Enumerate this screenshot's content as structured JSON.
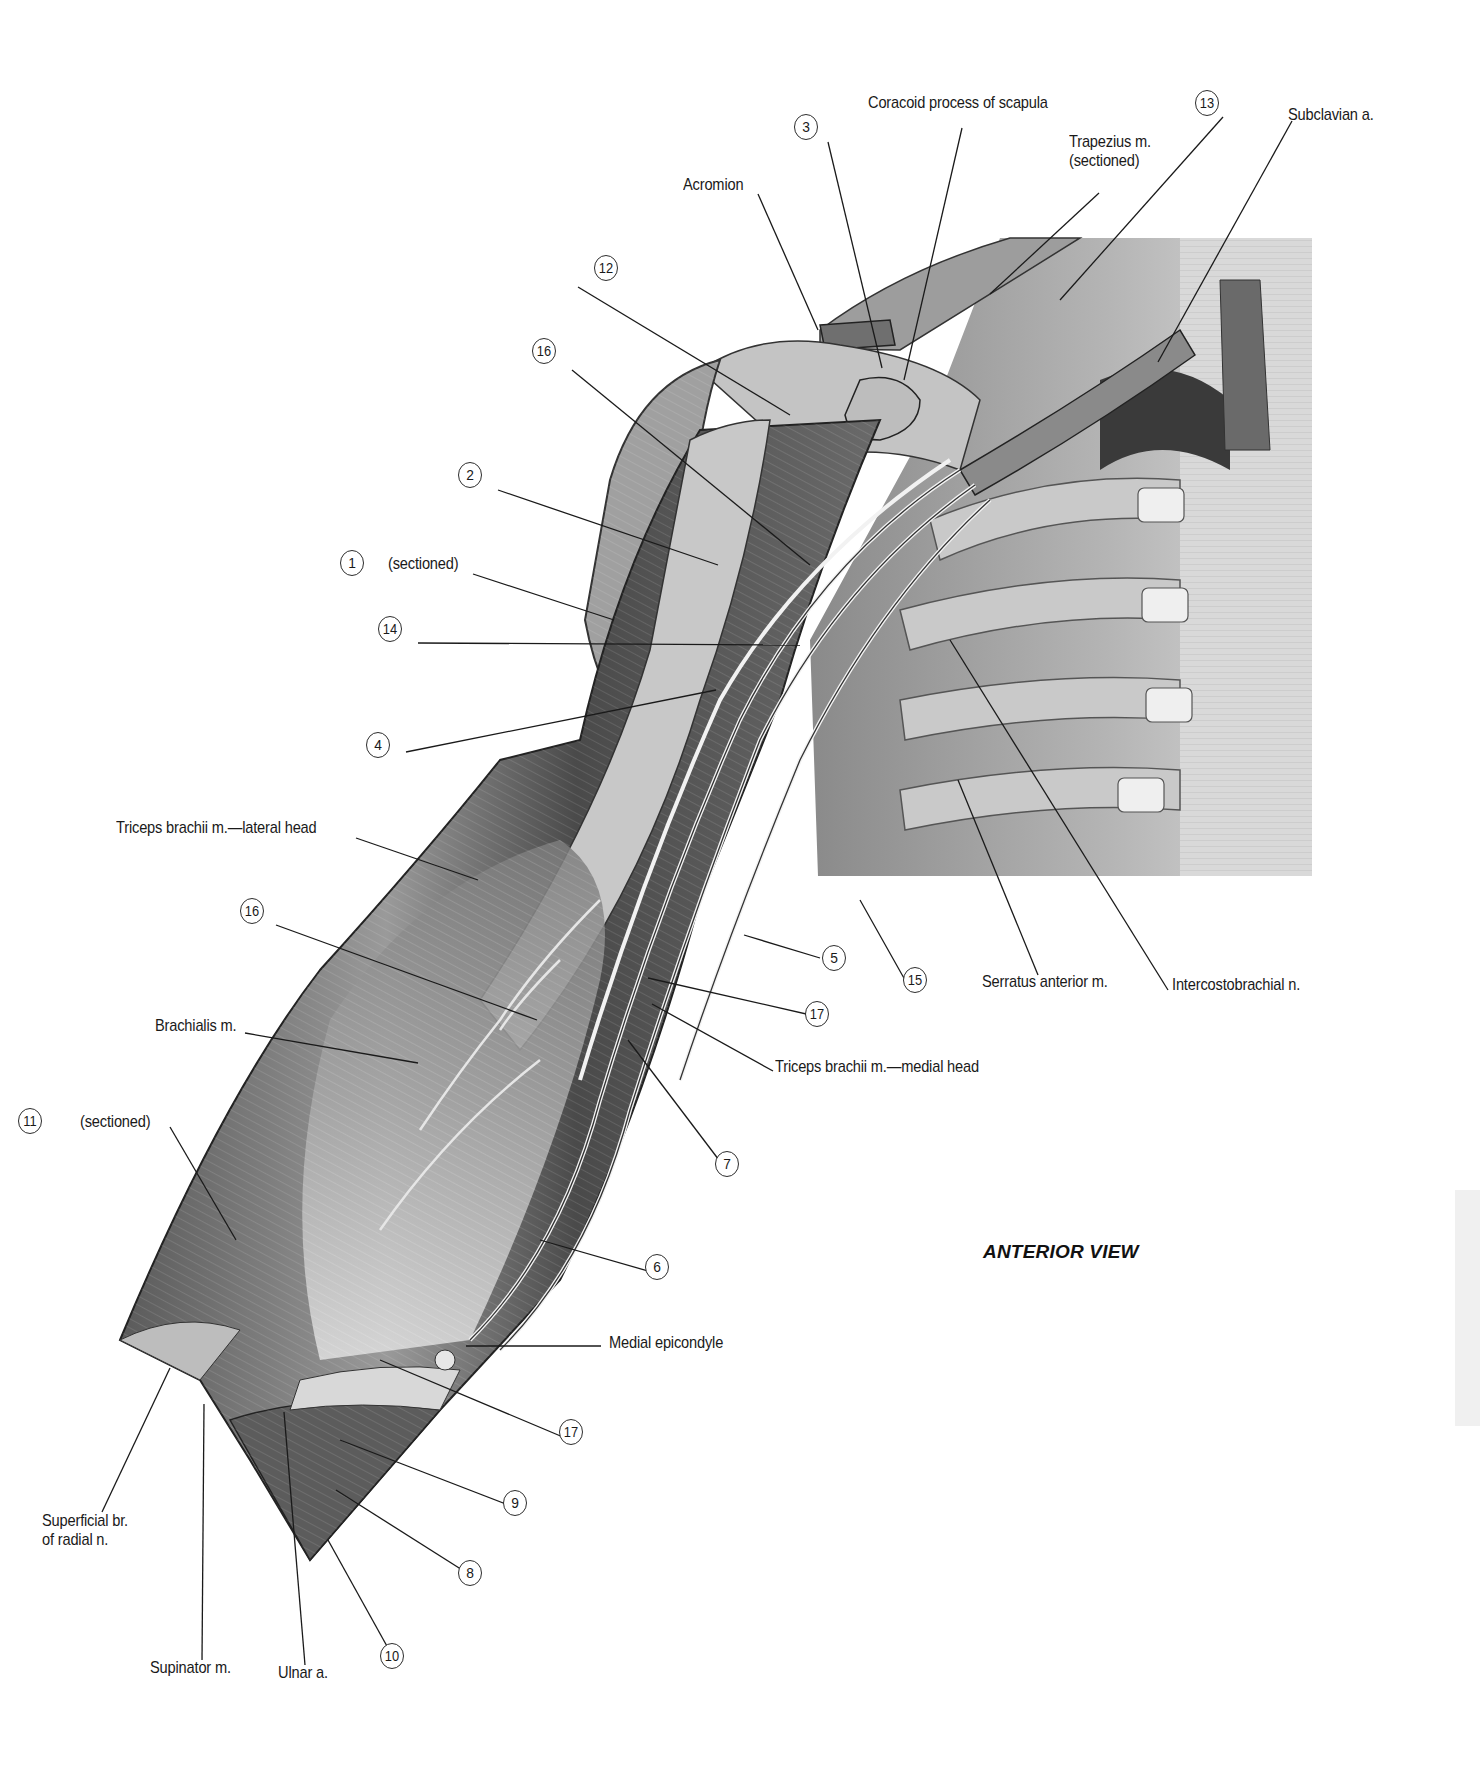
{
  "figure": {
    "view_title": "ANTERIOR VIEW",
    "colors": {
      "background": "#ffffff",
      "ink": "#1a1a1a",
      "muscle_dark": "#3c3c3c",
      "muscle_mid": "#7a7a7a",
      "muscle_light": "#b8b8b8",
      "tendon": "#e4e4e4",
      "side_tab": "#f0f0f0"
    }
  },
  "text_labels": [
    {
      "id": "coracoid",
      "text": "Coracoid process of scapula",
      "x": 868,
      "y": 103
    },
    {
      "id": "subclavian",
      "text": "Subclavian a.",
      "x": 1288,
      "y": 115
    },
    {
      "id": "trapezius",
      "text": "Trapezius m.\n(sectioned)",
      "x": 1069,
      "y": 142
    },
    {
      "id": "acromion",
      "text": "Acromion",
      "x": 683,
      "y": 185
    },
    {
      "id": "triceps-lateral",
      "text": "Triceps brachii m.—lateral head",
      "x": 116,
      "y": 828
    },
    {
      "id": "serratus",
      "text": "Serratus anterior m.",
      "x": 982,
      "y": 982
    },
    {
      "id": "intercostobrachial",
      "text": "Intercostobrachial n.",
      "x": 1172,
      "y": 985
    },
    {
      "id": "brachialis",
      "text": "Brachialis m.",
      "x": 155,
      "y": 1026
    },
    {
      "id": "triceps-medial",
      "text": "Triceps brachii m.—medial head",
      "x": 775,
      "y": 1067
    },
    {
      "id": "sectioned-11",
      "text": "(sectioned)",
      "x": 80,
      "y": 1122
    },
    {
      "id": "sectioned-1",
      "text": "(sectioned)",
      "x": 388,
      "y": 564
    },
    {
      "id": "medial-epicondyle",
      "text": "Medial epicondyle",
      "x": 609,
      "y": 1343
    },
    {
      "id": "superficial-radial",
      "text": "Superficial br.\nof radial n.",
      "x": 42,
      "y": 1521
    },
    {
      "id": "supinator",
      "text": "Supinator m.",
      "x": 150,
      "y": 1668
    },
    {
      "id": "ulnar",
      "text": "Ulnar a.",
      "x": 278,
      "y": 1673
    }
  ],
  "number_labels": [
    {
      "n": "1",
      "x": 352,
      "y": 563
    },
    {
      "n": "2",
      "x": 470,
      "y": 475
    },
    {
      "n": "3",
      "x": 806,
      "y": 127
    },
    {
      "n": "4",
      "x": 378,
      "y": 745
    },
    {
      "n": "5",
      "x": 834,
      "y": 958
    },
    {
      "n": "6",
      "x": 657,
      "y": 1267
    },
    {
      "n": "7",
      "x": 727,
      "y": 1164
    },
    {
      "n": "8",
      "x": 470,
      "y": 1573
    },
    {
      "n": "9",
      "x": 515,
      "y": 1503
    },
    {
      "n": "10",
      "x": 392,
      "y": 1656
    },
    {
      "n": "11",
      "x": 30,
      "y": 1121
    },
    {
      "n": "12",
      "x": 606,
      "y": 268
    },
    {
      "n": "13",
      "x": 1207,
      "y": 103
    },
    {
      "n": "14",
      "x": 390,
      "y": 629
    },
    {
      "n": "15",
      "x": 915,
      "y": 980
    },
    {
      "n": "16",
      "x": 544,
      "y": 351
    },
    {
      "n": "16",
      "x": 252,
      "y": 911
    },
    {
      "n": "17",
      "x": 817,
      "y": 1014
    },
    {
      "n": "17",
      "x": 571,
      "y": 1432
    }
  ],
  "leaders": [
    [
      962,
      128,
      904,
      380
    ],
    [
      1292,
      121,
      1158,
      362
    ],
    [
      1099,
      193,
      990,
      294
    ],
    [
      1223,
      117,
      1060,
      300
    ],
    [
      758,
      194,
      818,
      330
    ],
    [
      828,
      142,
      882,
      368
    ],
    [
      578,
      287,
      790,
      415
    ],
    [
      572,
      370,
      810,
      565
    ],
    [
      498,
      490,
      718,
      565
    ],
    [
      473,
      574,
      614,
      620
    ],
    [
      418,
      643,
      800,
      645
    ],
    [
      406,
      752,
      716,
      690
    ],
    [
      356,
      838,
      478,
      880
    ],
    [
      276,
      925,
      537,
      1020
    ],
    [
      245,
      1033,
      418,
      1063
    ],
    [
      170,
      1127,
      236,
      1240
    ],
    [
      820,
      958,
      744,
      935
    ],
    [
      815,
      1016,
      648,
      978
    ],
    [
      773,
      1071,
      652,
      1004
    ],
    [
      725,
      1168,
      628,
      1040
    ],
    [
      655,
      1273,
      540,
      1240
    ],
    [
      601,
      1346,
      466,
      1346
    ],
    [
      570,
      1440,
      380,
      1360
    ],
    [
      511,
      1506,
      340,
      1440
    ],
    [
      467,
      1573,
      336,
      1490
    ],
    [
      393,
      1657,
      328,
      1540
    ],
    [
      905,
      980,
      860,
      900
    ],
    [
      1038,
      975,
      958,
      780
    ],
    [
      1168,
      990,
      950,
      640
    ],
    [
      102,
      1512,
      170,
      1368
    ],
    [
      202,
      1660,
      204,
      1404
    ],
    [
      305,
      1665,
      284,
      1412
    ]
  ]
}
